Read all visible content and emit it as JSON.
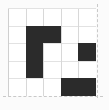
{
  "figure": {
    "title": "",
    "width": 109,
    "height": 110,
    "background_color": "#fbfbfb",
    "plot_background_color": "#ffffff"
  },
  "chart_data": {
    "type": "heatmap",
    "title": "",
    "subtitle": "",
    "xlabel": "",
    "ylabel": "",
    "rows": 5,
    "cols": 5,
    "xlim": [
      0,
      5
    ],
    "ylim": [
      0,
      5
    ],
    "x_tick_labels": [],
    "y_tick_labels": [],
    "legend": [],
    "annotations": [],
    "grid": true,
    "grid_color": "#dcdcdc",
    "legend_position": "none",
    "filled_color": "#2b2b2b",
    "empty_color": "#ffffff",
    "values": [
      [
        0,
        0,
        0,
        0,
        0
      ],
      [
        0,
        1,
        1,
        0,
        0
      ],
      [
        0,
        1,
        0,
        0,
        1
      ],
      [
        0,
        1,
        0,
        0,
        0
      ],
      [
        0,
        0,
        0,
        1,
        1
      ]
    ],
    "filled_cells": [
      {
        "row": 1,
        "col": 1
      },
      {
        "row": 1,
        "col": 2
      },
      {
        "row": 2,
        "col": 1
      },
      {
        "row": 2,
        "col": 4
      },
      {
        "row": 3,
        "col": 1
      },
      {
        "row": 4,
        "col": 3
      },
      {
        "row": 4,
        "col": 4
      }
    ]
  },
  "boundary": {
    "right_line_style": "dashed",
    "bottom_line_style": "dashed",
    "line_color": "#c9c9c9"
  }
}
